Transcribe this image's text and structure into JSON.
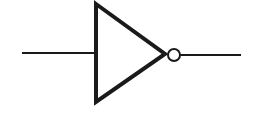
{
  "diagram": {
    "type": "logic-gate",
    "gate": "NOT",
    "components": [
      "input-line",
      "triangle-body",
      "inversion-bubble",
      "output-line"
    ],
    "colors": {
      "stroke": "#1a1a1a",
      "background": "#ffffff"
    }
  }
}
